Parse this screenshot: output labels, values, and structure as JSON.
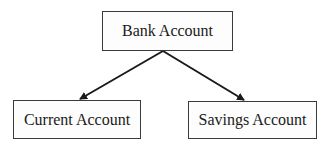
{
  "diagram": {
    "type": "tree",
    "nodes": [
      {
        "id": "root",
        "label": "Bank Account"
      },
      {
        "id": "left",
        "label": "Current Account"
      },
      {
        "id": "right",
        "label": "Savings Account"
      }
    ],
    "edges": [
      {
        "from": "root",
        "to": "left",
        "arrow": "end"
      },
      {
        "from": "root",
        "to": "right",
        "arrow": "end"
      }
    ],
    "colors": {
      "stroke": "#1a1a1a",
      "box_border": "#3a3a3a",
      "background": "#ffffff"
    }
  }
}
